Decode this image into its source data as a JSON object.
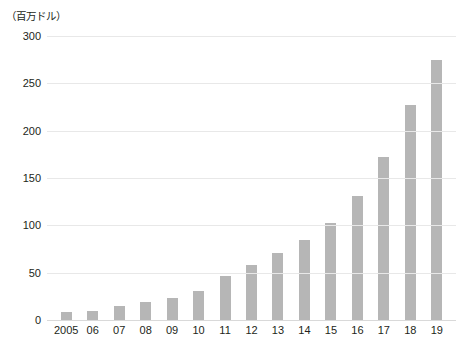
{
  "chart_data": {
    "type": "bar",
    "title": "",
    "subtitle": "",
    "unit_label": "（百万ドル）",
    "xlabel": "",
    "ylabel": "",
    "ylim": [
      0,
      300
    ],
    "yticks": [
      300,
      250,
      200,
      150,
      100,
      50,
      0
    ],
    "ytick_labels": [
      "300",
      "250",
      "200",
      "150",
      "100",
      "50",
      "0"
    ],
    "grid": true,
    "legend": "none",
    "bar_color": "#b6b6b6",
    "gridline_color": "#e8e8e8",
    "text_color": "#231f20",
    "background_color": "#ffffff",
    "categories": [
      "2005",
      "06",
      "07",
      "08",
      "09",
      "10",
      "11",
      "12",
      "13",
      "14",
      "15",
      "16",
      "17",
      "18",
      "19"
    ],
    "values": [
      8,
      10,
      15,
      19,
      23,
      31,
      46,
      58,
      71,
      85,
      103,
      131,
      172,
      227,
      275
    ],
    "series": [
      {
        "name": "",
        "values": [
          8,
          10,
          15,
          19,
          23,
          31,
          46,
          58,
          71,
          85,
          103,
          131,
          172,
          227,
          275
        ]
      }
    ]
  }
}
